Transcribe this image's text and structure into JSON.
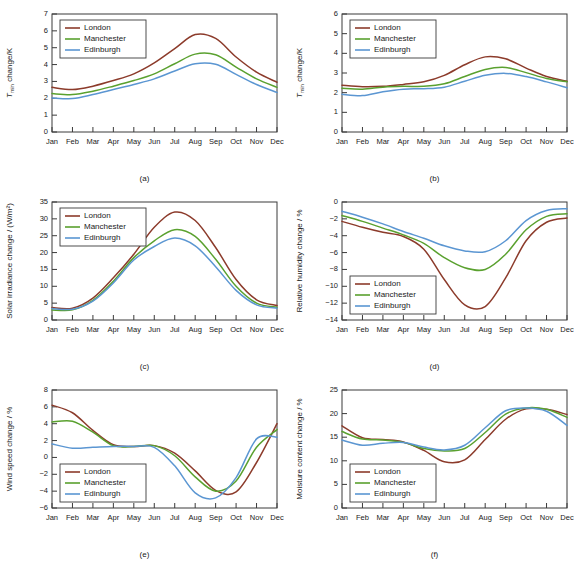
{
  "figure": {
    "title": "",
    "background": "#ffffff",
    "series_colors": {
      "London": "#8c3b2b",
      "Manchester": "#5aa12f",
      "Edinburgh": "#5b96d2"
    },
    "legend_labels": [
      "London",
      "Manchester",
      "Edinburgh"
    ],
    "months": [
      "Jan",
      "Feb",
      "Mar",
      "Apr",
      "May",
      "Jun",
      "Jul",
      "Aug",
      "Sep",
      "Oct",
      "Nov",
      "Dec"
    ]
  },
  "captions": {
    "a": "(a)",
    "b": "(b)",
    "c": "(c)",
    "d": "(d)",
    "e": "(e)",
    "f": "(f)"
  },
  "ylabels": {
    "a_main": "T",
    "a_sub": "min",
    "a_tail": " change/K",
    "b_main": "T",
    "b_sub": "min",
    "b_tail": " change/K",
    "c": "Solar irradiance change / (W/m²)",
    "d": "Relative humidity change / %",
    "e": "Wind speed change / %",
    "f": "Moisture content change / %"
  },
  "chart_data": [
    {
      "id": "a",
      "type": "line",
      "title": "(a)",
      "xlabel": "",
      "ylabel": "T_min change/K",
      "categories": [
        "Jan",
        "Feb",
        "Mar",
        "Apr",
        "May",
        "Jun",
        "Jul",
        "Aug",
        "Sep",
        "Oct",
        "Nov",
        "Dec"
      ],
      "ylim": [
        0,
        7
      ],
      "yticks": [
        0,
        1,
        2,
        3,
        4,
        5,
        6,
        7
      ],
      "grid": false,
      "legend_position": "top-left",
      "series": [
        {
          "name": "London",
          "values": [
            2.65,
            2.52,
            2.72,
            3.05,
            3.45,
            4.1,
            4.95,
            5.78,
            5.55,
            4.45,
            3.55,
            2.95
          ]
        },
        {
          "name": "Manchester",
          "values": [
            2.28,
            2.22,
            2.42,
            2.72,
            3.05,
            3.45,
            4.05,
            4.62,
            4.58,
            3.85,
            3.15,
            2.65
          ]
        },
        {
          "name": "Edinburgh",
          "values": [
            2.02,
            1.98,
            2.22,
            2.52,
            2.82,
            3.15,
            3.62,
            4.05,
            4.02,
            3.42,
            2.82,
            2.35
          ]
        }
      ]
    },
    {
      "id": "b",
      "type": "line",
      "title": "(b)",
      "xlabel": "",
      "ylabel": "T_min change/K",
      "categories": [
        "Jan",
        "Feb",
        "Mar",
        "Apr",
        "May",
        "Jun",
        "Jul",
        "Aug",
        "Sep",
        "Oct",
        "Nov",
        "Dec"
      ],
      "ylim": [
        0,
        6
      ],
      "yticks": [
        0,
        1,
        2,
        3,
        4,
        5,
        6
      ],
      "grid": false,
      "legend_position": "top-left",
      "series": [
        {
          "name": "London",
          "values": [
            2.38,
            2.3,
            2.32,
            2.42,
            2.55,
            2.88,
            3.42,
            3.82,
            3.72,
            3.25,
            2.82,
            2.58
          ]
        },
        {
          "name": "Manchester",
          "values": [
            2.22,
            2.18,
            2.28,
            2.32,
            2.32,
            2.45,
            2.82,
            3.18,
            3.28,
            3.02,
            2.72,
            2.55
          ]
        },
        {
          "name": "Edinburgh",
          "values": [
            1.92,
            1.85,
            2.05,
            2.18,
            2.2,
            2.28,
            2.58,
            2.88,
            2.98,
            2.82,
            2.55,
            2.25
          ]
        }
      ]
    },
    {
      "id": "c",
      "type": "line",
      "title": "(c)",
      "xlabel": "",
      "ylabel": "Solar irradiance change / (W/m²)",
      "categories": [
        "Jan",
        "Feb",
        "Mar",
        "Apr",
        "May",
        "Jun",
        "Jul",
        "Aug",
        "Sep",
        "Oct",
        "Nov",
        "Dec"
      ],
      "ylim": [
        0,
        35
      ],
      "yticks": [
        0,
        5,
        10,
        15,
        20,
        25,
        30,
        35
      ],
      "grid": false,
      "legend_position": "top-left",
      "series": [
        {
          "name": "London",
          "values": [
            3.7,
            3.5,
            6.5,
            12.5,
            19.5,
            27.5,
            32.0,
            29.5,
            21.5,
            12.0,
            6.0,
            4.3
          ]
        },
        {
          "name": "Manchester",
          "values": [
            3.0,
            3.0,
            5.8,
            11.5,
            18.5,
            23.5,
            26.8,
            24.8,
            18.0,
            10.0,
            5.0,
            3.8
          ]
        },
        {
          "name": "Edinburgh",
          "values": [
            3.4,
            3.2,
            5.6,
            11.0,
            17.8,
            21.8,
            24.3,
            22.0,
            15.8,
            8.8,
            4.5,
            3.5
          ]
        }
      ]
    },
    {
      "id": "d",
      "type": "line",
      "title": "(d)",
      "xlabel": "",
      "ylabel": "Relative humidity change / %",
      "categories": [
        "Jan",
        "Feb",
        "Mar",
        "Apr",
        "May",
        "Jun",
        "Jul",
        "Aug",
        "Sep",
        "Oct",
        "Nov",
        "Dec"
      ],
      "ylim": [
        -14,
        0
      ],
      "yticks": [
        -14,
        -12,
        -10,
        -8,
        -6,
        -4,
        -2,
        0
      ],
      "grid": false,
      "legend_position": "bottom-left",
      "series": [
        {
          "name": "London",
          "values": [
            -2.3,
            -3.0,
            -3.6,
            -4.1,
            -5.6,
            -9.2,
            -12.2,
            -12.4,
            -9.0,
            -4.6,
            -2.4,
            -1.9
          ]
        },
        {
          "name": "Manchester",
          "values": [
            -1.6,
            -2.3,
            -3.1,
            -3.9,
            -4.9,
            -6.6,
            -7.8,
            -8.0,
            -6.2,
            -3.3,
            -1.7,
            -1.4
          ]
        },
        {
          "name": "Edinburgh",
          "values": [
            -1.1,
            -1.8,
            -2.6,
            -3.5,
            -4.3,
            -5.2,
            -5.8,
            -5.9,
            -4.6,
            -2.2,
            -1.0,
            -0.8
          ]
        }
      ]
    },
    {
      "id": "e",
      "type": "line",
      "title": "(e)",
      "xlabel": "",
      "ylabel": "Wind speed change / %",
      "categories": [
        "Jan",
        "Feb",
        "Mar",
        "Apr",
        "May",
        "Jun",
        "Jul",
        "Aug",
        "Sep",
        "Oct",
        "Nov",
        "Dec"
      ],
      "ylim": [
        -6,
        8
      ],
      "yticks": [
        -6,
        -4,
        -2,
        0,
        2,
        4,
        6,
        8
      ],
      "grid": false,
      "legend_position": "bottom-left",
      "series": [
        {
          "name": "London",
          "values": [
            6.2,
            5.3,
            3.2,
            1.5,
            1.3,
            1.4,
            0.5,
            -1.6,
            -3.9,
            -4.1,
            -0.6,
            4.0
          ]
        },
        {
          "name": "Manchester",
          "values": [
            4.2,
            4.3,
            3.0,
            1.4,
            1.3,
            1.4,
            0.2,
            -2.3,
            -4.0,
            -2.8,
            1.2,
            3.3
          ]
        },
        {
          "name": "Edinburgh",
          "values": [
            1.6,
            1.1,
            1.2,
            1.3,
            1.3,
            1.2,
            -1.0,
            -4.2,
            -4.8,
            -2.4,
            2.2,
            2.4
          ]
        }
      ]
    },
    {
      "id": "f",
      "type": "line",
      "title": "(f)",
      "xlabel": "",
      "ylabel": "Moisture content change / %",
      "categories": [
        "Jan",
        "Feb",
        "Mar",
        "Apr",
        "May",
        "Jun",
        "Jul",
        "Aug",
        "Sep",
        "Oct",
        "Nov",
        "Dec"
      ],
      "ylim": [
        0,
        25
      ],
      "yticks": [
        0,
        5,
        10,
        15,
        20,
        25
      ],
      "grid": false,
      "legend_position": "bottom-left",
      "series": [
        {
          "name": "London",
          "values": [
            17.4,
            14.9,
            14.5,
            14.0,
            12.2,
            9.8,
            10.2,
            14.5,
            18.8,
            21.0,
            20.9,
            19.8
          ]
        },
        {
          "name": "Manchester",
          "values": [
            16.2,
            14.6,
            14.4,
            13.9,
            12.6,
            12.1,
            12.6,
            16.0,
            19.9,
            21.2,
            20.9,
            19.2
          ]
        },
        {
          "name": "Edinburgh",
          "values": [
            14.4,
            13.3,
            13.7,
            13.9,
            12.9,
            12.3,
            13.3,
            17.0,
            20.6,
            21.2,
            20.5,
            17.5
          ]
        }
      ]
    }
  ]
}
